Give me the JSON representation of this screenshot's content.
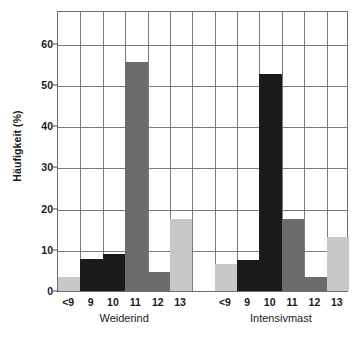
{
  "chart_data": {
    "type": "bar",
    "title": "",
    "xlabel": "",
    "ylabel": "Häufigkeit (%)",
    "ylim": [
      0,
      68
    ],
    "yticks": [
      0,
      10,
      20,
      30,
      40,
      50,
      60
    ],
    "ytick_labels": [
      "0",
      "10",
      "20",
      "30",
      "40",
      "50",
      "60"
    ],
    "grid": true,
    "legend": "none",
    "groups": [
      {
        "name": "Weiderind",
        "categories": [
          "<9",
          "9",
          "10",
          "11",
          "12",
          "13"
        ],
        "values": [
          3.3,
          7.8,
          9.0,
          55.5,
          4.6,
          17.5
        ],
        "colors": [
          "#c8c8c8",
          "#1a1a1a",
          "#1a1a1a",
          "#6b6b6b",
          "#6b6b6b",
          "#c8c8c8"
        ]
      },
      {
        "name": "Intensivmast",
        "categories": [
          "<9",
          "9",
          "10",
          "11",
          "12",
          "13"
        ],
        "values": [
          6.5,
          7.5,
          52.7,
          17.5,
          3.5,
          13.0
        ],
        "colors": [
          "#c8c8c8",
          "#1a1a1a",
          "#1a1a1a",
          "#6b6b6b",
          "#6b6b6b",
          "#c8c8c8"
        ]
      }
    ],
    "palette": {
      "black": "#1a1a1a",
      "mid_gray": "#6b6b6b",
      "light_gray": "#c8c8c8",
      "grid": "#7a7a7a",
      "frame": "#6e6e6e",
      "background": "#ffffff"
    }
  }
}
